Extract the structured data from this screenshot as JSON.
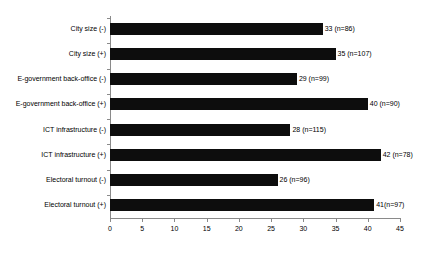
{
  "figure": {
    "clipped_top_text": "",
    "background_color": "#ffffff",
    "bar_color": "#0d0d0d",
    "axis_color": "#8a8a8a"
  },
  "chart_data": {
    "type": "bar",
    "orientation": "horizontal",
    "title": "",
    "xlabel": "",
    "ylabel": "",
    "grid": false,
    "legend": null,
    "xlim": [
      0,
      45
    ],
    "xticks": [
      0,
      5,
      10,
      15,
      20,
      25,
      30,
      35,
      40,
      45
    ],
    "xticklabels": [
      "0",
      "5",
      "10",
      "15",
      "20",
      "25",
      "30",
      "35",
      "40",
      "45"
    ],
    "categories": [
      "City size (-)",
      "City size (+)",
      "E-government back-office (-)",
      "E-government back-office (+)",
      "ICT infrastructure (-)",
      "ICT infrastructure (+)",
      "Electoral turnout (-)",
      "Electoral turnout (+)"
    ],
    "values": [
      33,
      35,
      29,
      40,
      28,
      42,
      26,
      41
    ],
    "n": [
      86,
      107,
      99,
      90,
      115,
      78,
      96,
      97
    ],
    "point_labels": [
      "33 (n=86)",
      "35 (n=107)",
      "29 (n=99)",
      "40 (n=90)",
      "28 (n=115)",
      "42 (n=78)",
      "26 (n=96)",
      "41(n=97)"
    ]
  }
}
